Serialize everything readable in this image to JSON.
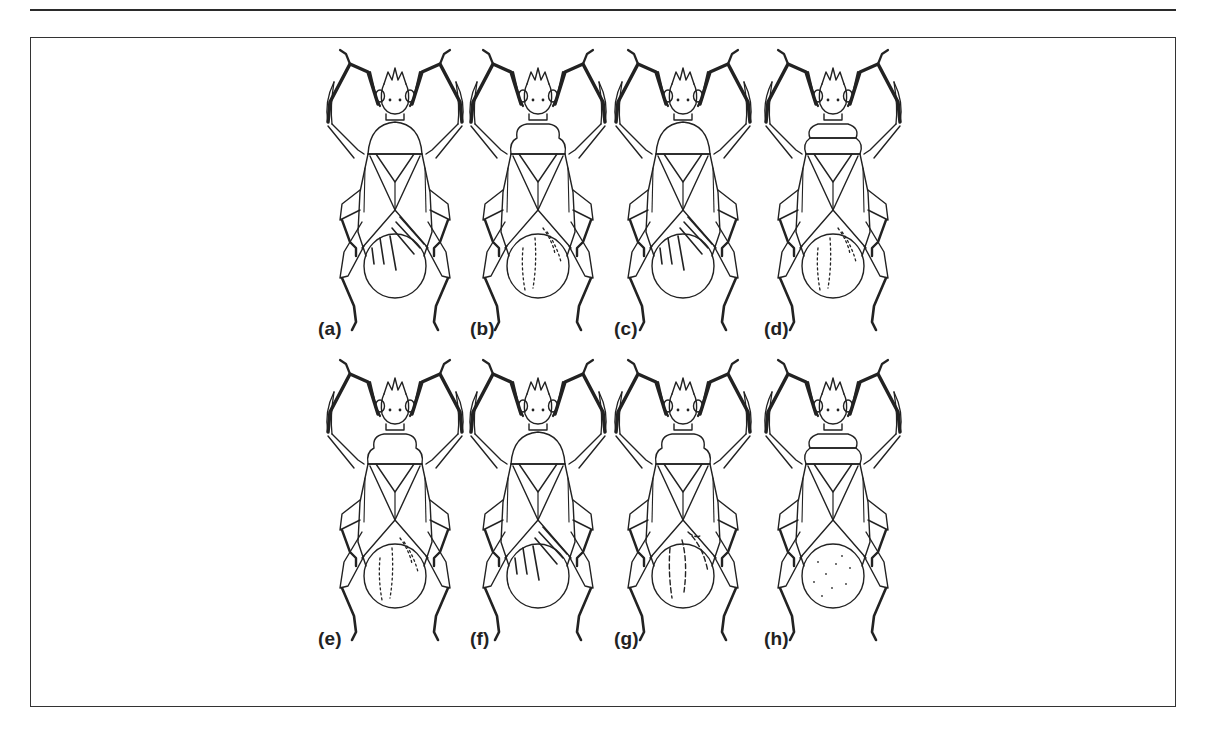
{
  "figure": {
    "panels": [
      {
        "id": "a",
        "label": "(a)",
        "hindwing_pattern": "stripes",
        "pronotum": "round",
        "col": 0,
        "row": 0
      },
      {
        "id": "b",
        "label": "(b)",
        "hindwing_pattern": "dots",
        "pronotum": "lobed",
        "col": 1,
        "row": 0
      },
      {
        "id": "c",
        "label": "(c)",
        "hindwing_pattern": "stripes",
        "pronotum": "round",
        "col": 2,
        "row": 0
      },
      {
        "id": "d",
        "label": "(d)",
        "hindwing_pattern": "dots",
        "pronotum": "banded",
        "col": 3,
        "row": 0
      },
      {
        "id": "e",
        "label": "(e)",
        "hindwing_pattern": "dots",
        "pronotum": "lobed",
        "col": 0,
        "row": 1
      },
      {
        "id": "f",
        "label": "(f)",
        "hindwing_pattern": "stripes",
        "pronotum": "round",
        "col": 1,
        "row": 1
      },
      {
        "id": "g",
        "label": "(g)",
        "hindwing_pattern": "dashes",
        "pronotum": "lobed",
        "col": 2,
        "row": 1
      },
      {
        "id": "h",
        "label": "(h)",
        "hindwing_pattern": "speckle",
        "pronotum": "banded",
        "col": 3,
        "row": 1
      }
    ],
    "colors": {
      "ink": "#222222",
      "paper": "#ffffff",
      "frame": "#333333"
    }
  }
}
